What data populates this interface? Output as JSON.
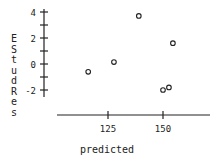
{
  "chart_data": {
    "type": "scatter",
    "title": "",
    "xlabel": "predicted",
    "ylabel": "EStudRes",
    "xlim": [
      101,
      171
    ],
    "ylim": [
      -2.5,
      4.2
    ],
    "xticks": [
      125,
      150
    ],
    "yticks": [
      4,
      3,
      2,
      1,
      0,
      -1,
      -2
    ],
    "ytick_labels": [
      "4",
      "2",
      "0",
      "-2"
    ],
    "grid": false,
    "legend": null,
    "marker": "open-circle",
    "points": [
      {
        "x": 116,
        "y": -0.6
      },
      {
        "x": 127.7,
        "y": 0.15
      },
      {
        "x": 139,
        "y": 3.7
      },
      {
        "x": 154.5,
        "y": 1.6
      },
      {
        "x": 150,
        "y": -2.0
      },
      {
        "x": 152.7,
        "y": -1.8
      }
    ]
  },
  "axis_labels": {
    "x": "predicted",
    "y_letters": [
      "E",
      "S",
      "t",
      "u",
      "d",
      "R",
      "e",
      "s"
    ]
  },
  "colors": {
    "axis": "#222222",
    "marker": "#222222",
    "background": "#ffffff"
  }
}
